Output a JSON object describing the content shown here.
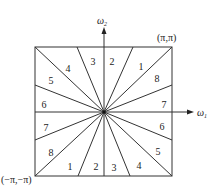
{
  "diagram": {
    "axes": {
      "horizontal": {
        "symbol": "ω",
        "subscript": "1"
      },
      "vertical": {
        "symbol": "ω",
        "subscript": "2"
      }
    },
    "corners": {
      "top_right": "(π,π)",
      "bottom_left": "(−π,−π)"
    },
    "regions": {
      "top": [
        "3",
        "2"
      ],
      "top_left": [
        "4"
      ],
      "left": [
        "5",
        "6",
        "7",
        "8"
      ],
      "top_right": [
        "1",
        "8"
      ],
      "right": [
        "7",
        "6",
        "5"
      ],
      "bottom_right": [
        "4"
      ],
      "bottom": [
        "1",
        "2",
        "3"
      ]
    },
    "labels": [
      {
        "text": "3",
        "x": 93,
        "y": 65
      },
      {
        "text": "2",
        "x": 112,
        "y": 65
      },
      {
        "text": "4",
        "x": 68,
        "y": 72
      },
      {
        "text": "1",
        "x": 141,
        "y": 70
      },
      {
        "text": "5",
        "x": 51,
        "y": 84
      },
      {
        "text": "8",
        "x": 157,
        "y": 82
      },
      {
        "text": "6",
        "x": 44,
        "y": 108
      },
      {
        "text": "7",
        "x": 164,
        "y": 108
      },
      {
        "text": "7",
        "x": 46,
        "y": 131
      },
      {
        "text": "6",
        "x": 162,
        "y": 130
      },
      {
        "text": "8",
        "x": 51,
        "y": 156
      },
      {
        "text": "5",
        "x": 158,
        "y": 155
      },
      {
        "text": "1",
        "x": 70,
        "y": 170
      },
      {
        "text": "2",
        "x": 96,
        "y": 170
      },
      {
        "text": "3",
        "x": 114,
        "y": 171
      },
      {
        "text": "4",
        "x": 139,
        "y": 169
      }
    ]
  }
}
